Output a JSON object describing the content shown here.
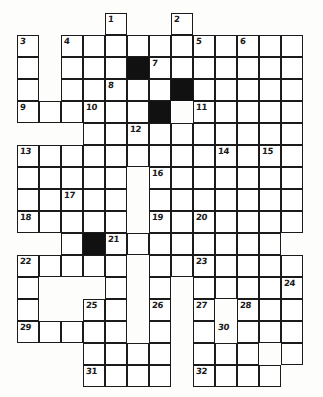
{
  "puzzle": {
    "title": "Crossword Grid",
    "type": "crossword",
    "columns": 13,
    "rows": 17,
    "cell_size": 22,
    "origin_x": 17,
    "origin_y": 13,
    "colors": {
      "grid_line": "#1b1b1b",
      "cell_fill": "#ffffff",
      "block_fill": "#111111",
      "number_color": "#1a1a1a",
      "page_background": "#fdfdfc"
    },
    "open_cells": [
      [
        4,
        0
      ],
      [
        4,
        1
      ],
      [
        7,
        0
      ],
      [
        7,
        1
      ],
      [
        0,
        1
      ],
      [
        0,
        2
      ],
      [
        0,
        3
      ],
      [
        0,
        4
      ],
      [
        2,
        1
      ],
      [
        3,
        1
      ],
      [
        4,
        1
      ],
      [
        5,
        1
      ],
      [
        6,
        1
      ],
      [
        8,
        1
      ],
      [
        9,
        1
      ],
      [
        10,
        1
      ],
      [
        11,
        1
      ],
      [
        12,
        1
      ],
      [
        2,
        2
      ],
      [
        3,
        2
      ],
      [
        4,
        2
      ],
      [
        6,
        2
      ],
      [
        7,
        2
      ],
      [
        8,
        2
      ],
      [
        9,
        2
      ],
      [
        10,
        2
      ],
      [
        11,
        2
      ],
      [
        12,
        2
      ],
      [
        2,
        3
      ],
      [
        3,
        3
      ],
      [
        4,
        3
      ],
      [
        5,
        3
      ],
      [
        6,
        3
      ],
      [
        7,
        3
      ],
      [
        8,
        3
      ],
      [
        9,
        3
      ],
      [
        10,
        3
      ],
      [
        11,
        3
      ],
      [
        12,
        3
      ],
      [
        0,
        4
      ],
      [
        1,
        4
      ],
      [
        2,
        4
      ],
      [
        3,
        4
      ],
      [
        4,
        4
      ],
      [
        5,
        4
      ],
      [
        6,
        4
      ],
      [
        8,
        4
      ],
      [
        9,
        4
      ],
      [
        10,
        4
      ],
      [
        11,
        4
      ],
      [
        12,
        4
      ],
      [
        3,
        5
      ],
      [
        4,
        5
      ],
      [
        5,
        5
      ],
      [
        6,
        5
      ],
      [
        7,
        5
      ],
      [
        8,
        5
      ],
      [
        9,
        5
      ],
      [
        10,
        5
      ],
      [
        11,
        5
      ],
      [
        12,
        5
      ],
      [
        0,
        6
      ],
      [
        1,
        6
      ],
      [
        2,
        6
      ],
      [
        3,
        6
      ],
      [
        4,
        6
      ],
      [
        5,
        6
      ],
      [
        6,
        6
      ],
      [
        7,
        6
      ],
      [
        8,
        6
      ],
      [
        9,
        6
      ],
      [
        10,
        6
      ],
      [
        11,
        6
      ],
      [
        12,
        6
      ],
      [
        0,
        7
      ],
      [
        1,
        7
      ],
      [
        2,
        7
      ],
      [
        3,
        7
      ],
      [
        4,
        7
      ],
      [
        6,
        7
      ],
      [
        7,
        7
      ],
      [
        8,
        7
      ],
      [
        9,
        7
      ],
      [
        10,
        7
      ],
      [
        11,
        7
      ],
      [
        12,
        7
      ],
      [
        0,
        8
      ],
      [
        1,
        8
      ],
      [
        2,
        8
      ],
      [
        3,
        8
      ],
      [
        4,
        8
      ],
      [
        6,
        8
      ],
      [
        7,
        8
      ],
      [
        8,
        8
      ],
      [
        9,
        8
      ],
      [
        10,
        8
      ],
      [
        11,
        8
      ],
      [
        12,
        8
      ],
      [
        0,
        9
      ],
      [
        1,
        9
      ],
      [
        2,
        9
      ],
      [
        3,
        9
      ],
      [
        4,
        9
      ],
      [
        6,
        9
      ],
      [
        7,
        9
      ],
      [
        8,
        9
      ],
      [
        9,
        9
      ],
      [
        10,
        9
      ],
      [
        11,
        9
      ],
      [
        12,
        9
      ],
      [
        2,
        10
      ],
      [
        3,
        10
      ],
      [
        4,
        10
      ],
      [
        5,
        10
      ],
      [
        6,
        10
      ],
      [
        7,
        10
      ],
      [
        8,
        10
      ],
      [
        9,
        10
      ],
      [
        10,
        10
      ],
      [
        11,
        10
      ],
      [
        0,
        11
      ],
      [
        1,
        11
      ],
      [
        2,
        11
      ],
      [
        3,
        11
      ],
      [
        4,
        11
      ],
      [
        6,
        11
      ],
      [
        7,
        11
      ],
      [
        8,
        11
      ],
      [
        9,
        11
      ],
      [
        10,
        11
      ],
      [
        11,
        11
      ],
      [
        12,
        11
      ],
      [
        0,
        12
      ],
      [
        4,
        12
      ],
      [
        6,
        12
      ],
      [
        8,
        12
      ],
      [
        9,
        12
      ],
      [
        10,
        12
      ],
      [
        11,
        12
      ],
      [
        12,
        12
      ],
      [
        0,
        13
      ],
      [
        3,
        13
      ],
      [
        4,
        13
      ],
      [
        6,
        13
      ],
      [
        8,
        13
      ],
      [
        10,
        13
      ],
      [
        11,
        13
      ],
      [
        12,
        13
      ],
      [
        0,
        14
      ],
      [
        1,
        14
      ],
      [
        2,
        14
      ],
      [
        3,
        14
      ],
      [
        4,
        14
      ],
      [
        6,
        14
      ],
      [
        8,
        14
      ],
      [
        10,
        14
      ],
      [
        11,
        14
      ],
      [
        12,
        14
      ],
      [
        3,
        15
      ],
      [
        4,
        15
      ],
      [
        5,
        15
      ],
      [
        6,
        15
      ],
      [
        8,
        15
      ],
      [
        9,
        15
      ],
      [
        10,
        15
      ],
      [
        12,
        15
      ],
      [
        3,
        16
      ],
      [
        4,
        16
      ],
      [
        5,
        16
      ],
      [
        6,
        16
      ],
      [
        8,
        16
      ],
      [
        9,
        16
      ],
      [
        10,
        16
      ],
      [
        11,
        16
      ]
    ],
    "block_cells": [
      [
        5,
        2
      ],
      [
        7,
        3
      ],
      [
        6,
        4
      ],
      [
        3,
        10
      ]
    ],
    "numbered_cells": [
      {
        "number": "1",
        "col": 4,
        "row": 0
      },
      {
        "number": "2",
        "col": 7,
        "row": 0
      },
      {
        "number": "3",
        "col": 0,
        "row": 1
      },
      {
        "number": "4",
        "col": 2,
        "row": 1
      },
      {
        "number": "5",
        "col": 8,
        "row": 1
      },
      {
        "number": "6",
        "col": 10,
        "row": 1
      },
      {
        "number": "7",
        "col": 6,
        "row": 2
      },
      {
        "number": "8",
        "col": 4,
        "row": 3
      },
      {
        "number": "9",
        "col": 0,
        "row": 4
      },
      {
        "number": "10",
        "col": 3,
        "row": 4
      },
      {
        "number": "11",
        "col": 8,
        "row": 4
      },
      {
        "number": "12",
        "col": 5,
        "row": 5
      },
      {
        "number": "13",
        "col": 0,
        "row": 6
      },
      {
        "number": "14",
        "col": 9,
        "row": 6
      },
      {
        "number": "15",
        "col": 11,
        "row": 6
      },
      {
        "number": "16",
        "col": 6,
        "row": 7
      },
      {
        "number": "17",
        "col": 2,
        "row": 8
      },
      {
        "number": "18",
        "col": 0,
        "row": 9
      },
      {
        "number": "19",
        "col": 6,
        "row": 9
      },
      {
        "number": "20",
        "col": 8,
        "row": 9
      },
      {
        "number": "21",
        "col": 4,
        "row": 10
      },
      {
        "number": "22",
        "col": 0,
        "row": 11
      },
      {
        "number": "23",
        "col": 8,
        "row": 11
      },
      {
        "number": "24",
        "col": 12,
        "row": 12
      },
      {
        "number": "25",
        "col": 3,
        "row": 13
      },
      {
        "number": "26",
        "col": 6,
        "row": 13
      },
      {
        "number": "27",
        "col": 8,
        "row": 13
      },
      {
        "number": "28",
        "col": 10,
        "row": 13
      },
      {
        "number": "29",
        "col": 0,
        "row": 14
      },
      {
        "number": "30",
        "col": 9,
        "row": 14
      },
      {
        "number": "31",
        "col": 3,
        "row": 16
      },
      {
        "number": "32",
        "col": 8,
        "row": 16
      }
    ]
  }
}
